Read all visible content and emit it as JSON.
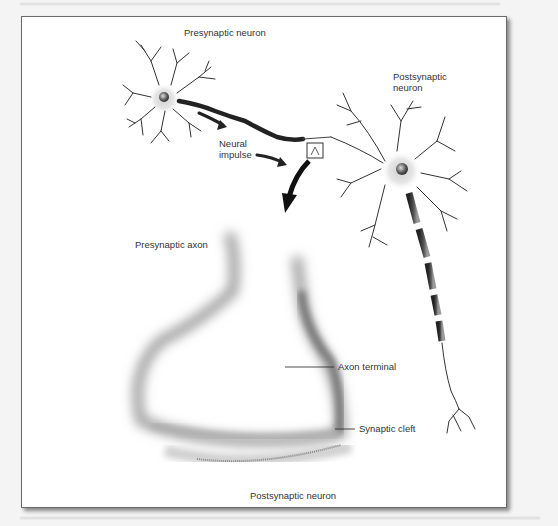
{
  "figure": {
    "labels": {
      "presynaptic_neuron": "Presynaptic  neuron",
      "postsynaptic_neuron_top_line1": "Postsynaptic",
      "postsynaptic_neuron_top_line2": "neuron",
      "neural_impulse_line1": "Neural",
      "neural_impulse_line2": "impulse",
      "presynaptic_axon": "Presynaptic axon",
      "axon_terminal": "Axon terminal",
      "synaptic_cleft": "Synaptic cleft",
      "postsynaptic_neuron_bottom": "Postsynaptic neuron"
    },
    "colors": {
      "frame_border": "#6a6a6a",
      "ink": "#222222",
      "label_text": "#333333",
      "page_background": "#f4f4f4"
    }
  }
}
